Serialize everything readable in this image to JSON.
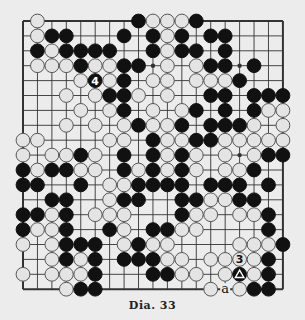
{
  "caption": "Dia. 33",
  "board": {
    "size": 19,
    "origin": {
      "x": 23,
      "y": 21
    },
    "spacing": {
      "x": 14.44,
      "y": 14.9
    },
    "colors": {
      "line": "#333333",
      "black": "#111111",
      "white": "#e4e4e4",
      "white_stroke": "#555555"
    },
    "star_points": [
      [
        3,
        9
      ],
      [
        3,
        15
      ],
      [
        9,
        15
      ]
    ],
    "rows": [
      ".W......BWWWB......",
      ".WBB...B.BWB.BB....",
      ".BWBBBB..BWBB.B....",
      ".WWWBWWBB.W.WBB.B..",
      "....WBWB.WW.WWWB...",
      "...W.WBBW.W..BB.BBB",
      "....W.WB.W.WB.B.BWW",
      "...W.W.WBWWB.BBBW.W",
      "WW....WW.BWWBBWWWWW",
      "W.WWBW.B.BWBW.W.WBB",
      "BWBBWW.BWBWBW.WWB..",
      "BB..B.WWBBBB.BBB.B.",
      "..BB..WBB..BBWWBB..",
      "BBWB.WWW...BWW.WWB.",
      "BWWB..BW.BBWW....B.",
      "W.WBBB.WBWW....WWWB",
      "..WBWB.BBBWW.WWWWB.",
      "W.WWWB...BBWW.WBWB.",
      "...WBB.......W.WBB."
    ],
    "markers": [
      {
        "row": 4,
        "col": 5,
        "type": "number",
        "label": "4"
      },
      {
        "row": 16,
        "col": 15,
        "type": "number",
        "label": "3"
      },
      {
        "row": 17,
        "col": 15,
        "type": "triangle",
        "label": "△"
      },
      {
        "row": 18,
        "col": 14,
        "type": "letter",
        "label": "a"
      }
    ]
  }
}
